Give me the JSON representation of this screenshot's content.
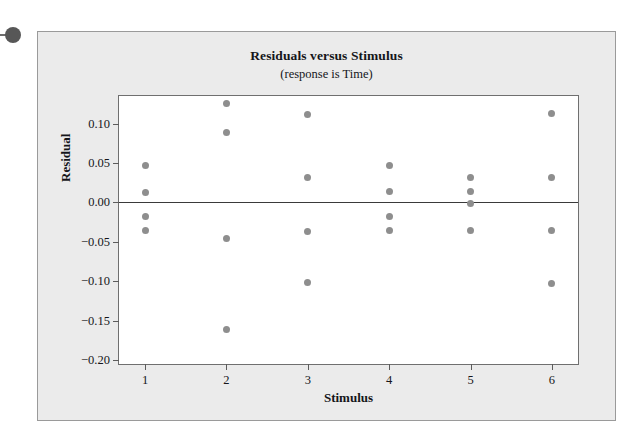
{
  "figure": {
    "pin_icon": "pin-marker-icon",
    "background_color": "#ebebeb",
    "plot_background_color": "#ffffff",
    "marker_color": "#8e8e8e",
    "frame_color": "#6f6f6f",
    "zero_line_color": "#3a3a3a"
  },
  "chart_data": {
    "type": "scatter",
    "title": "Residuals versus Stimulus",
    "subtitle": "(response is Time)",
    "xlabel": "Stimulus",
    "ylabel": "Residual",
    "xlim": [
      0.68,
      6.32
    ],
    "ylim": [
      -0.205,
      0.135
    ],
    "xticks": [
      1,
      2,
      3,
      4,
      5,
      6
    ],
    "xticklabels": [
      "1",
      "2",
      "3",
      "4",
      "5",
      "6"
    ],
    "yticks": [
      0.1,
      0.05,
      0.0,
      -0.05,
      -0.1,
      -0.15,
      -0.2
    ],
    "yticklabels": [
      "0.10",
      "0.05",
      "0.00",
      "−0.05",
      "−0.10",
      "−0.15",
      "−0.20"
    ],
    "grid": false,
    "legend": false,
    "reference_line": {
      "orientation": "horizontal",
      "y": 0.0
    },
    "series": [
      {
        "name": "Residuals",
        "marker": "filled-circle",
        "color": "#8e8e8e",
        "points": [
          {
            "x": 1,
            "y": 0.047
          },
          {
            "x": 1,
            "y": 0.012
          },
          {
            "x": 1,
            "y": -0.018
          },
          {
            "x": 1,
            "y": -0.036
          },
          {
            "x": 2,
            "y": 0.125
          },
          {
            "x": 2,
            "y": 0.089
          },
          {
            "x": 2,
            "y": -0.046
          },
          {
            "x": 2,
            "y": -0.161
          },
          {
            "x": 3,
            "y": 0.112
          },
          {
            "x": 3,
            "y": 0.032
          },
          {
            "x": 3,
            "y": -0.037
          },
          {
            "x": 3,
            "y": -0.102
          },
          {
            "x": 4,
            "y": 0.047
          },
          {
            "x": 4,
            "y": 0.014
          },
          {
            "x": 4,
            "y": -0.018
          },
          {
            "x": 4,
            "y": -0.036
          },
          {
            "x": 5,
            "y": 0.032
          },
          {
            "x": 5,
            "y": 0.014
          },
          {
            "x": 5,
            "y": -0.002
          },
          {
            "x": 5,
            "y": -0.036
          },
          {
            "x": 6,
            "y": 0.113
          },
          {
            "x": 6,
            "y": 0.032
          },
          {
            "x": 6,
            "y": -0.036
          },
          {
            "x": 6,
            "y": -0.103
          }
        ]
      }
    ]
  }
}
